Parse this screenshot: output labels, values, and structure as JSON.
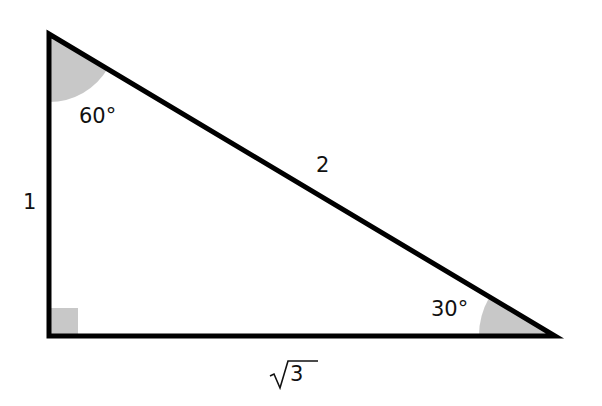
{
  "diagram": {
    "vertices": {
      "top": [
        49,
        34
      ],
      "right_angle": [
        49,
        336
      ],
      "far": [
        555,
        336
      ]
    },
    "colors": {
      "stroke": "#000000",
      "angle_fill": "#c8c8c8"
    },
    "labels": {
      "vertical_side": "1",
      "hypotenuse": "2",
      "base": "√3",
      "base_radicand": "3",
      "top_angle": "60°",
      "far_angle": "30°"
    }
  }
}
